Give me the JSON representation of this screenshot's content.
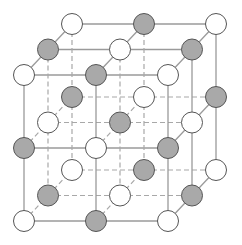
{
  "diagram": {
    "type": "crystal-lattice",
    "grid_size": 3,
    "origin": [
      24,
      75
    ],
    "step_x": 72,
    "step_y": 73,
    "depth_offset": [
      24,
      -25.5
    ],
    "atom_radius": 10.5,
    "colors": {
      "white_atom_fill": "#ffffff",
      "gray_atom_fill": "#a9a9a9",
      "atom_stroke": "#555555",
      "solid_line": "#9a9a9a",
      "dashed_line": "#a8a8a8"
    },
    "parity_rule": "even index sum = white, odd index sum = gray"
  }
}
